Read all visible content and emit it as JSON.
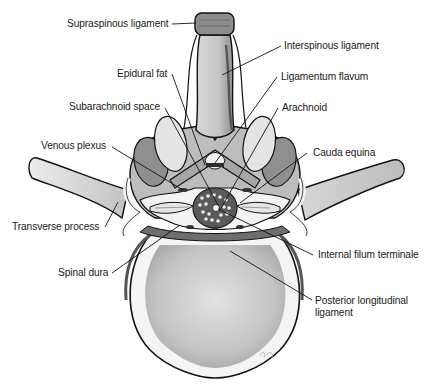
{
  "figure": {
    "colors": {
      "background": "#ffffff",
      "outline": "#111111",
      "bone_light": "#e6e6e6",
      "bone_mid": "#c8c8c8",
      "bone_dark": "#8c8c8c",
      "ligament": "#b5b5b5",
      "dura": "#6e6e6e",
      "canal_dark": "#2a2a2a",
      "label_text": "#1a1a1a"
    },
    "labels": [
      {
        "id": "supraspinous-ligament",
        "text": "Supraspinous ligament",
        "side": "left"
      },
      {
        "id": "interspinous-ligament",
        "text": "Interspinous ligament",
        "side": "right"
      },
      {
        "id": "epidural-fat",
        "text": "Epidural fat",
        "side": "left"
      },
      {
        "id": "ligamentum-flavum",
        "text": "Ligamentum flavum",
        "side": "right"
      },
      {
        "id": "subarachnoid-space",
        "text": "Subarachnoid space",
        "side": "left"
      },
      {
        "id": "arachnoid",
        "text": "Arachnoid",
        "side": "right"
      },
      {
        "id": "venous-plexus",
        "text": "Venous plexus",
        "side": "left"
      },
      {
        "id": "cauda-equina",
        "text": "Cauda equina",
        "side": "right"
      },
      {
        "id": "transverse-process",
        "text": "Transverse process",
        "side": "left"
      },
      {
        "id": "internal-filum-terminale",
        "text": "Internal filum terminale",
        "side": "right"
      },
      {
        "id": "spinal-dura",
        "text": "Spinal dura",
        "side": "left"
      },
      {
        "id": "posterior-longitudinal-ligament",
        "text": "Posterior longitudinal ligament",
        "line1": "Posterior longitudinal",
        "line2": "ligament",
        "side": "right"
      }
    ]
  }
}
